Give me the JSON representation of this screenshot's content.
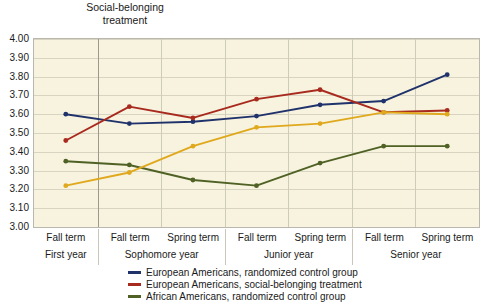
{
  "annotation": {
    "text": "Social-belonging\ntreatment",
    "at_index": 1
  },
  "chart_data": {
    "type": "line",
    "title": "",
    "xlabel": "",
    "ylabel": "",
    "ylim": [
      3.0,
      4.0
    ],
    "ytick_step": 0.1,
    "grid": true,
    "legend_position": "bottom",
    "yticks": [
      "4.00",
      "3.90",
      "3.80",
      "3.70",
      "3.60",
      "3.50",
      "3.40",
      "3.30",
      "3.20",
      "3.10",
      "3.00"
    ],
    "x": [
      "Fall term",
      "Fall term",
      "Spring term",
      "Fall term",
      "Spring term",
      "Fall term",
      "Spring term"
    ],
    "x_groups": [
      {
        "year": "First year",
        "terms": [
          "Fall term"
        ]
      },
      {
        "year": "Sophomore year",
        "terms": [
          "Fall term",
          "Spring term"
        ]
      },
      {
        "year": "Junior year",
        "terms": [
          "Fall term",
          "Spring term"
        ]
      },
      {
        "year": "Senior year",
        "terms": [
          "Fall term",
          "Spring term"
        ]
      }
    ],
    "series": [
      {
        "name": "European Americans, randomized control group",
        "color": "#20326b",
        "in_legend": true,
        "values": [
          3.6,
          3.55,
          3.56,
          3.59,
          3.65,
          3.67,
          3.81
        ]
      },
      {
        "name": "European Americans, social-belonging treatment",
        "color": "#a82a1e",
        "in_legend": true,
        "values": [
          3.46,
          3.64,
          3.58,
          3.68,
          3.73,
          3.61,
          3.62
        ]
      },
      {
        "name": "African Americans, randomized control group",
        "color": "#4f6124",
        "in_legend": true,
        "values": [
          3.35,
          3.33,
          3.25,
          3.22,
          3.34,
          3.43,
          3.43
        ]
      },
      {
        "name": "African Americans, social-belonging treatment",
        "color": "#e0a81c",
        "in_legend": false,
        "values": [
          3.22,
          3.29,
          3.43,
          3.53,
          3.55,
          3.61,
          3.6
        ]
      }
    ]
  }
}
